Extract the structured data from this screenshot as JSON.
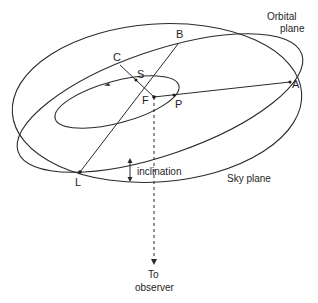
{
  "diagram": {
    "planes": {
      "orbital": "Orbital",
      "orbital_line2": "plane",
      "sky": "Sky plane"
    },
    "points": {
      "A": "A",
      "B": "B",
      "C": "C",
      "S": "S",
      "F": "F",
      "P": "P",
      "L": "L"
    },
    "annotations": {
      "inclination": "inclination",
      "observer_line1": "To",
      "observer_line2": "observer"
    },
    "colors": {
      "stroke": "#2a2a2a",
      "background": "#ffffff"
    }
  }
}
